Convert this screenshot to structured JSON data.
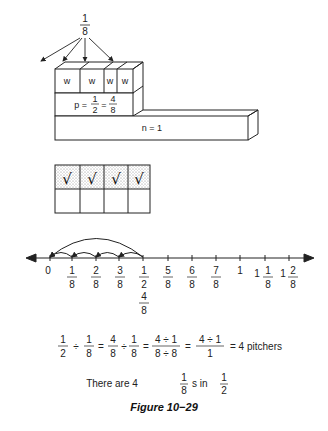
{
  "figure": {
    "caption": "Figure 10−29",
    "top_fraction": {
      "num": "1",
      "den": "8"
    },
    "block_model": {
      "w_label": "w",
      "w_count": 4,
      "p_label": "p =",
      "p_frac1": {
        "num": "1",
        "den": "2"
      },
      "p_eq": "=",
      "p_frac2": {
        "num": "4",
        "den": "8"
      },
      "n_label": "n = 1"
    },
    "grid": {
      "check": "√",
      "columns": 4,
      "rows": 2,
      "shaded_row": 1
    },
    "number_line": {
      "ticks": [
        {
          "whole": "0",
          "num": "",
          "den": ""
        },
        {
          "whole": "",
          "num": "1",
          "den": "8"
        },
        {
          "whole": "",
          "num": "2",
          "den": "8"
        },
        {
          "whole": "",
          "num": "3",
          "den": "8"
        },
        {
          "whole": "",
          "num": "1",
          "den": "2",
          "alt": "4",
          "alt_den": "8"
        },
        {
          "whole": "",
          "num": "5",
          "den": "8"
        },
        {
          "whole": "",
          "num": "6",
          "den": "8"
        },
        {
          "whole": "",
          "num": "7",
          "den": "8"
        },
        {
          "whole": "1",
          "num": "",
          "den": ""
        },
        {
          "whole": "1",
          "num": "1",
          "den": "8"
        },
        {
          "whole": "1",
          "num": "2",
          "den": "8"
        }
      ]
    },
    "equation": {
      "f1": {
        "num": "1",
        "den": "2"
      },
      "op1": "÷",
      "f2": {
        "num": "1",
        "den": "8"
      },
      "eq1": "=",
      "f3": {
        "num": "4",
        "den": "8"
      },
      "op2": "÷",
      "f4": {
        "num": "1",
        "den": "8"
      },
      "eq2": "=",
      "f5": {
        "num": "4 ÷ 1",
        "den": "8 ÷ 8"
      },
      "eq3": "=",
      "f6": {
        "num": "4 ÷ 1",
        "den": "1"
      },
      "result": "= 4  pitchers"
    },
    "statement": {
      "prefix": "There are 4",
      "frac1": {
        "num": "1",
        "den": "8"
      },
      "middle": "s  in",
      "frac2": {
        "num": "1",
        "den": "2"
      }
    }
  }
}
